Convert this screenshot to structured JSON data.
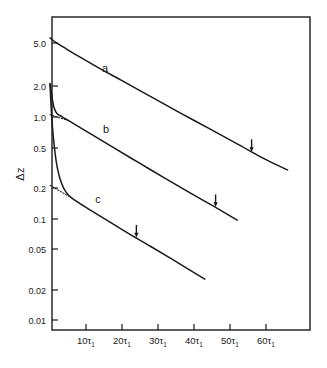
{
  "figure": {
    "background": "#ffffff",
    "ink": "#1a1a1a",
    "frame": {
      "left": 52,
      "top": 17,
      "right": 310,
      "bottom": 330
    }
  },
  "axes": {
    "y_title": "Δz",
    "x_title": "",
    "y_scale": "log",
    "x_scale": "linear",
    "grid": false,
    "y_ticks": [
      {
        "label": "5.0",
        "value": 5.0,
        "y": 43
      },
      {
        "label": "2.0",
        "value": 2.0,
        "y": 86
      },
      {
        "label": "1.0",
        "value": 1.0,
        "y": 117
      },
      {
        "label": "0.5",
        "value": 0.5,
        "y": 148
      },
      {
        "label": "0.2",
        "value": 0.2,
        "y": 188
      },
      {
        "label": "0.1",
        "value": 0.1,
        "y": 219
      },
      {
        "label": "0.05",
        "value": 0.05,
        "y": 249
      },
      {
        "label": "0.02",
        "value": 0.02,
        "y": 290
      },
      {
        "label": "0.01",
        "value": 0.01,
        "y": 320
      }
    ],
    "x_ticks": [
      {
        "label": "10τ",
        "sub": "1",
        "value": 10,
        "x": 86
      },
      {
        "label": "20τ",
        "sub": "1",
        "value": 20,
        "x": 122
      },
      {
        "label": "30τ",
        "sub": "1",
        "value": 30,
        "x": 158
      },
      {
        "label": "40τ",
        "sub": "1",
        "value": 40,
        "x": 194
      },
      {
        "label": "50τ",
        "sub": "1",
        "value": 50,
        "x": 230
      },
      {
        "label": "60τ",
        "sub": "1",
        "value": 60,
        "x": 266
      }
    ]
  },
  "chart_data": {
    "type": "line",
    "title": "",
    "xlabel": "",
    "ylabel": "Δz",
    "x_unit": "τ₁",
    "yscale": "log",
    "xlim": [
      0,
      72
    ],
    "ylim": [
      0.008,
      8.0
    ],
    "grid": false,
    "legend": "inline-labels",
    "series": [
      {
        "name": "a",
        "label": "a",
        "label_pos": {
          "x": 105,
          "y": 72
        },
        "color": "#1a1a1a",
        "style": "solid",
        "initial_value": 5.6,
        "decay_note": "single exponential, slow decay",
        "points": [
          {
            "x": 0,
            "y": 5.6
          },
          {
            "x": 1.5,
            "y": 5.1
          },
          {
            "x": 4,
            "y": 4.5
          },
          {
            "x": 8,
            "y": 3.7
          },
          {
            "x": 14,
            "y": 2.8
          },
          {
            "x": 20,
            "y": 2.15
          },
          {
            "x": 28,
            "y": 1.5
          },
          {
            "x": 36,
            "y": 1.05
          },
          {
            "x": 44,
            "y": 0.74
          },
          {
            "x": 52,
            "y": 0.52
          },
          {
            "x": 60,
            "y": 0.365
          },
          {
            "x": 66,
            "y": 0.29
          }
        ],
        "arrow": {
          "x": 56,
          "y_curve": 0.43,
          "label": "arrow-marker-a"
        }
      },
      {
        "name": "b",
        "label": "b",
        "label_pos": {
          "x": 106,
          "y": 133
        },
        "color": "#1a1a1a",
        "style": "solid",
        "initial_value": 2.0,
        "decay_note": "fast initial transient to ~1.0 then single exponential",
        "points": [
          {
            "x": 0,
            "y": 2.0
          },
          {
            "x": 0.6,
            "y": 1.45
          },
          {
            "x": 1.2,
            "y": 1.15
          },
          {
            "x": 2.0,
            "y": 1.02
          },
          {
            "x": 3.5,
            "y": 0.95
          },
          {
            "x": 7,
            "y": 0.8
          },
          {
            "x": 12,
            "y": 0.63
          },
          {
            "x": 18,
            "y": 0.47
          },
          {
            "x": 25,
            "y": 0.335
          },
          {
            "x": 32,
            "y": 0.24
          },
          {
            "x": 40,
            "y": 0.165
          },
          {
            "x": 46,
            "y": 0.125
          },
          {
            "x": 52,
            "y": 0.094
          }
        ],
        "arrow": {
          "x": 46,
          "y_curve": 0.125,
          "label": "arrow-marker-b"
        },
        "asymptote": {
          "style": "dotted",
          "from": {
            "x": 0,
            "y": 1.0
          },
          "to": {
            "x": 5,
            "y": 0.88
          }
        }
      },
      {
        "name": "c",
        "label": "c",
        "label_pos": {
          "x": 98,
          "y": 203
        },
        "color": "#1a1a1a",
        "style": "solid",
        "initial_value": 2.0,
        "decay_note": "very fast transient to ~0.17 then single exponential",
        "points": [
          {
            "x": 0,
            "y": 2.0
          },
          {
            "x": 0.4,
            "y": 1.05
          },
          {
            "x": 0.9,
            "y": 0.62
          },
          {
            "x": 1.5,
            "y": 0.4
          },
          {
            "x": 2.2,
            "y": 0.285
          },
          {
            "x": 3.2,
            "y": 0.215
          },
          {
            "x": 4.5,
            "y": 0.175
          },
          {
            "x": 6,
            "y": 0.155
          },
          {
            "x": 10,
            "y": 0.125
          },
          {
            "x": 16,
            "y": 0.093
          },
          {
            "x": 22,
            "y": 0.069
          },
          {
            "x": 28,
            "y": 0.052
          },
          {
            "x": 34,
            "y": 0.039
          },
          {
            "x": 40,
            "y": 0.029
          },
          {
            "x": 43,
            "y": 0.025
          }
        ],
        "arrow": {
          "x": 24,
          "y_curve": 0.063,
          "label": "arrow-marker-c"
        },
        "asymptote": {
          "style": "dotted",
          "from": {
            "x": 0,
            "y": 0.205
          },
          "to": {
            "x": 6,
            "y": 0.155
          }
        }
      }
    ]
  }
}
